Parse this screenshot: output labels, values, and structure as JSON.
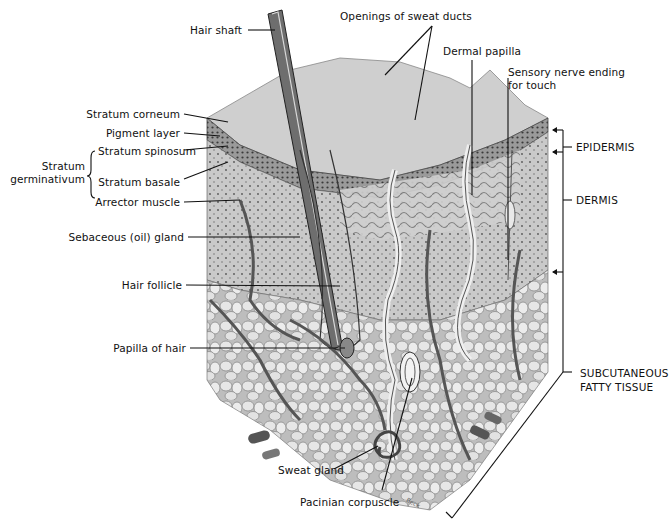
{
  "diagram": {
    "labels": {
      "hair_shaft": "Hair shaft",
      "openings_sweat_ducts": "Openings of sweat ducts",
      "dermal_papilla": "Dermal papilla",
      "sensory_nerve_line1": "Sensory nerve ending",
      "sensory_nerve_line2": "for touch",
      "stratum_corneum": "Stratum corneum",
      "pigment_layer": "Pigment layer",
      "stratum_germinativum_line1": "Stratum",
      "stratum_germinativum_line2": "germinativum",
      "stratum_spinosum": "Stratum spinosum",
      "stratum_basale": "Stratum basale",
      "arrector_muscle": "Arrector muscle",
      "sebaceous_gland": "Sebaceous (oil) gland",
      "hair_follicle": "Hair follicle",
      "papilla_of_hair": "Papilla of hair",
      "sweat_gland": "Sweat gland",
      "pacinian_corpuscle": "Pacinian corpuscle"
    },
    "layers": {
      "epidermis": "EPIDERMIS",
      "dermis": "DERMIS",
      "subcutaneous_line1": "SUBCUTANEOUS",
      "subcutaneous_line2": "FATTY TISSUE"
    },
    "credit": "Beck",
    "colors": {
      "background": "#ffffff",
      "surface": "#cfcfcf",
      "epidermis": "#8a8a8a",
      "dermis": "#c4c4c4",
      "fat": "#d9d9d9",
      "vessel": "#5a5a5a",
      "line": "#111111"
    }
  }
}
